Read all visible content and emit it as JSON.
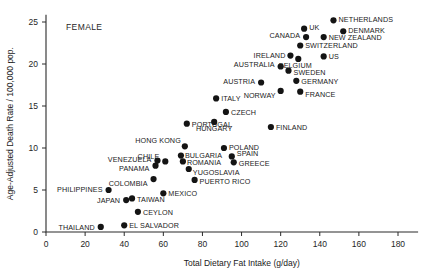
{
  "chart_data": {
    "type": "scatter",
    "title": "",
    "annotation": "FEMALE",
    "xlabel": "Total Dietary Fat Intake (g/day)",
    "ylabel": "Age-Adjusted Death Rate / 100,000 pop.",
    "xlim": [
      0,
      190
    ],
    "ylim": [
      0,
      25.8
    ],
    "xticks": [
      0,
      20,
      40,
      60,
      80,
      100,
      120,
      140,
      160,
      180
    ],
    "yticks": [
      0,
      5,
      10,
      15,
      20,
      25
    ],
    "grid": false,
    "legend": "none",
    "marker_color": "#141414",
    "points": [
      {
        "label": "THAILAND",
        "x": 28,
        "y": 0.6,
        "lx": -6,
        "ly": 3,
        "anchor": "end"
      },
      {
        "label": "EL SALVADOR",
        "x": 40,
        "y": 0.8,
        "lx": 5,
        "ly": 3,
        "anchor": "start"
      },
      {
        "label": "CEYLON",
        "x": 47,
        "y": 2.4,
        "lx": 5,
        "ly": 3,
        "anchor": "start"
      },
      {
        "label": "JAPAN",
        "x": 41,
        "y": 3.8,
        "lx": -6,
        "ly": 3,
        "anchor": "end"
      },
      {
        "label": "TAIWAN",
        "x": 44,
        "y": 4.0,
        "lx": 5,
        "ly": 4,
        "anchor": "start"
      },
      {
        "label": "PHILIPPINES",
        "x": 32,
        "y": 5.0,
        "lx": -6,
        "ly": 2,
        "anchor": "end"
      },
      {
        "label": "MEXICO",
        "x": 60,
        "y": 4.6,
        "lx": 5,
        "ly": 3,
        "anchor": "start"
      },
      {
        "label": "COLOMBIA",
        "x": 55,
        "y": 6.3,
        "lx": -6,
        "ly": 7,
        "anchor": "end"
      },
      {
        "label": "PUERTO RICO",
        "x": 76,
        "y": 6.2,
        "lx": 5,
        "ly": 4,
        "anchor": "start"
      },
      {
        "label": "PANAMA",
        "x": 56,
        "y": 7.9,
        "lx": -6,
        "ly": 5,
        "anchor": "end"
      },
      {
        "label": "VENEZUELA",
        "x": 57,
        "y": 8.5,
        "lx": -6,
        "ly": 1,
        "anchor": "end"
      },
      {
        "label": "YUGOSLAVIA",
        "x": 73,
        "y": 7.5,
        "lx": 4,
        "ly": 6,
        "anchor": "start"
      },
      {
        "label": "ROMANIA",
        "x": 70,
        "y": 8.4,
        "lx": 4,
        "ly": 4,
        "anchor": "start"
      },
      {
        "label": "CHILE",
        "x": 61,
        "y": 8.4,
        "lx": -6,
        "ly": -2,
        "anchor": "end"
      },
      {
        "label": "BULGARIA",
        "x": 69,
        "y": 9.1,
        "lx": 4,
        "ly": 2,
        "anchor": "start"
      },
      {
        "label": "GREECE",
        "x": 96,
        "y": 8.3,
        "lx": 5,
        "ly": 4,
        "anchor": "start"
      },
      {
        "label": "SPAIN",
        "x": 95,
        "y": 9.0,
        "lx": 5,
        "ly": 0,
        "anchor": "start"
      },
      {
        "label": "HONG KONG",
        "x": 71,
        "y": 10.2,
        "lx": -4,
        "ly": -3,
        "anchor": "end"
      },
      {
        "label": "POLAND",
        "x": 91,
        "y": 10.0,
        "lx": 5,
        "ly": 2,
        "anchor": "start"
      },
      {
        "label": "PORTUGAL",
        "x": 72,
        "y": 12.9,
        "lx": 5,
        "ly": 3,
        "anchor": "start"
      },
      {
        "label": "HUNGARY",
        "x": 86,
        "y": 13.1,
        "lx": 0,
        "ly": 9,
        "anchor": "middle"
      },
      {
        "label": "FINLAND",
        "x": 115,
        "y": 12.5,
        "lx": 5,
        "ly": 3,
        "anchor": "start"
      },
      {
        "label": "CZECH",
        "x": 92,
        "y": 14.3,
        "lx": 5,
        "ly": 3,
        "anchor": "start"
      },
      {
        "label": "ITALY",
        "x": 87,
        "y": 15.9,
        "lx": 5,
        "ly": 3,
        "anchor": "start"
      },
      {
        "label": "NORWAY",
        "x": 120,
        "y": 16.8,
        "lx": -5,
        "ly": 7,
        "anchor": "end"
      },
      {
        "label": "FRANCE",
        "x": 130,
        "y": 16.7,
        "lx": 5,
        "ly": 5,
        "anchor": "start"
      },
      {
        "label": "AUSTRIA",
        "x": 110,
        "y": 17.8,
        "lx": -6,
        "ly": 2,
        "anchor": "end"
      },
      {
        "label": "GERMANY",
        "x": 128,
        "y": 18.0,
        "lx": 5,
        "ly": 3,
        "anchor": "start"
      },
      {
        "label": "SWEDEN",
        "x": 124,
        "y": 19.2,
        "lx": 5,
        "ly": 4,
        "anchor": "start"
      },
      {
        "label": "AUSTRALIA",
        "x": 120,
        "y": 19.7,
        "lx": -6,
        "ly": 0,
        "anchor": "end"
      },
      {
        "label": "BELGIUM",
        "x": 129,
        "y": 20.6,
        "lx": -3,
        "ly": 9,
        "anchor": "middle"
      },
      {
        "label": "US",
        "x": 142,
        "y": 20.9,
        "lx": 5,
        "ly": 3,
        "anchor": "start"
      },
      {
        "label": "IRELAND",
        "x": 125,
        "y": 21.0,
        "lx": -5,
        "ly": 2,
        "anchor": "end"
      },
      {
        "label": "SWITZERLAND",
        "x": 130,
        "y": 22.2,
        "lx": 5,
        "ly": 2,
        "anchor": "start"
      },
      {
        "label": "CANADA",
        "x": 133,
        "y": 23.2,
        "lx": -6,
        "ly": 1,
        "anchor": "end"
      },
      {
        "label": "NEW ZEALAND",
        "x": 142,
        "y": 23.2,
        "lx": 5,
        "ly": 3,
        "anchor": "start"
      },
      {
        "label": "UK",
        "x": 132,
        "y": 24.2,
        "lx": 5,
        "ly": 1,
        "anchor": "start"
      },
      {
        "label": "DENMARK",
        "x": 152,
        "y": 23.9,
        "lx": 5,
        "ly": 2,
        "anchor": "start"
      },
      {
        "label": "NETHERLANDS",
        "x": 147,
        "y": 25.2,
        "lx": 5,
        "ly": 2,
        "anchor": "start"
      }
    ]
  }
}
